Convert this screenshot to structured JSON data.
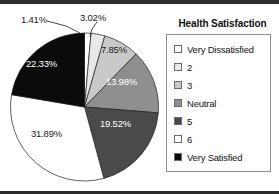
{
  "chart_data": {
    "type": "pie",
    "title": "Health Satisfaction",
    "xlabel": "",
    "ylabel": "",
    "legend_position": "right",
    "grid": false,
    "start_angle_deg": 0,
    "direction": "clockwise",
    "categories": [
      "Very Dissatisfied",
      "2",
      "3",
      "Neutral",
      "5",
      "6",
      "Very Satisfied"
    ],
    "values": [
      1.41,
      3.02,
      7.85,
      13.98,
      19.52,
      31.89,
      22.33
    ],
    "value_unit": "%",
    "slices": [
      {
        "label": "Very Dissatisfied",
        "value": 1.41,
        "display": "1.41%",
        "color": "#ffffff",
        "label_color": "#1a1a1a",
        "callout": true
      },
      {
        "label": "2",
        "value": 3.02,
        "display": "3.02%",
        "color": "#e8e8e8",
        "label_color": "#1a1a1a",
        "callout": true
      },
      {
        "label": "3",
        "value": 7.85,
        "display": "7.85%",
        "color": "#c9c9c9",
        "label_color": "#1a1a1a",
        "callout": false
      },
      {
        "label": "Neutral",
        "value": 13.98,
        "display": "13.98%",
        "color": "#8f8f8f",
        "label_color": "#ffffff",
        "callout": false
      },
      {
        "label": "5",
        "value": 19.52,
        "display": "19.52%",
        "color": "#4a4a4a",
        "label_color": "#ffffff",
        "callout": false
      },
      {
        "label": "6",
        "value": 31.89,
        "display": "31.89%",
        "color": "#ffffff",
        "label_color": "#1a1a1a",
        "callout": false
      },
      {
        "label": "Very Satisfied",
        "value": 22.33,
        "display": "22.33%",
        "color": "#0b0b0b",
        "label_color": "#ffffff",
        "callout": false
      }
    ]
  },
  "legend": {
    "title": "Health Satisfaction",
    "items": [
      {
        "label": "Very Dissatisfied",
        "color": "#ffffff"
      },
      {
        "label": "2",
        "color": "#e8e8e8"
      },
      {
        "label": "3",
        "color": "#c9c9c9"
      },
      {
        "label": "Neutral",
        "color": "#8f8f8f"
      },
      {
        "label": "5",
        "color": "#4a4a4a"
      },
      {
        "label": "6",
        "color": "#ffffff"
      },
      {
        "label": "Very Satisfied",
        "color": "#0b0b0b"
      }
    ]
  },
  "slice_labels": [
    {
      "text": "1.41%",
      "x": 21,
      "y": 14
    },
    {
      "text": "3.02%",
      "x": 80,
      "y": 12
    },
    {
      "text": "7.85%",
      "x": 101,
      "y": 44
    },
    {
      "text": "13.98%",
      "x": 106,
      "y": 76
    },
    {
      "text": "19.52%",
      "x": 100,
      "y": 118
    },
    {
      "text": "31.89%",
      "x": 31,
      "y": 128
    },
    {
      "text": "22.33%",
      "x": 26,
      "y": 58
    }
  ]
}
